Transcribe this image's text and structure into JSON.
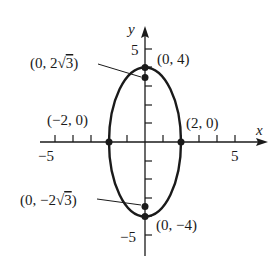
{
  "diagram": {
    "type": "ellipse-graph",
    "axes": {
      "x_label": "x",
      "y_label": "y",
      "x_ticks": {
        "min": -5,
        "max": 5,
        "labels": [
          "-5",
          "5"
        ]
      },
      "y_ticks": {
        "min": -5,
        "max": 5,
        "labels": [
          "5",
          "-5"
        ]
      }
    },
    "ellipse": {
      "center": [
        0,
        0
      ],
      "semi_x": 2,
      "semi_y": 4
    },
    "points": [
      {
        "label": "(0, 4)",
        "x": 0,
        "y": 4
      },
      {
        "label": "(0, 2√3)",
        "x": 0,
        "y": 3.464
      },
      {
        "label": "(−2, 0)",
        "x": -2,
        "y": 0
      },
      {
        "label": "(2, 0)",
        "x": 2,
        "y": 0
      },
      {
        "label": "(0, −2√3)",
        "x": 0,
        "y": -3.464
      },
      {
        "label": "(0, −4)",
        "x": 0,
        "y": -4
      }
    ],
    "colors": {
      "stroke": "#1a1a1a",
      "background": "#ffffff"
    }
  },
  "labels": {
    "x_axis": "x",
    "y_axis": "y",
    "tick_pos5_x": "5",
    "tick_neg5_x": "−5",
    "tick_pos5_y": "5",
    "tick_neg5_y": "−5",
    "pt_top": "(0, 4)",
    "pt_focus_top_pre": "(0, 2",
    "pt_focus_top_rad": "3",
    "pt_focus_top_post": ")",
    "pt_left": "(−2, 0)",
    "pt_right": "(2, 0)",
    "pt_focus_bot_pre": "(0, −2",
    "pt_focus_bot_rad": "3",
    "pt_focus_bot_post": ")",
    "pt_bottom": "(0, −4)"
  }
}
